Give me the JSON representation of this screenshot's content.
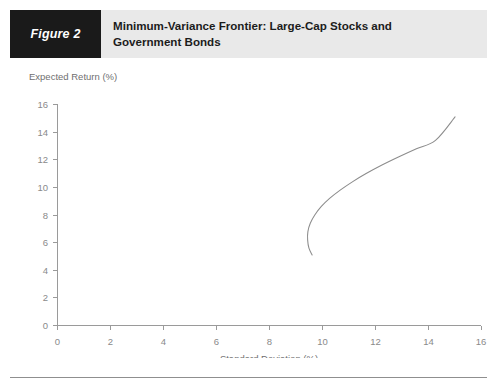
{
  "header": {
    "figure_number": "Figure 2",
    "title_line_1": "Minimum-Variance Frontier: Large-Cap Stocks and",
    "title_line_2": "Government Bonds",
    "band_color": "#e9e9e9",
    "number_box_color": "#1a1a1a",
    "number_text_color": "#ffffff"
  },
  "chart_data": {
    "type": "line",
    "title": "Minimum-Variance Frontier: Large-Cap Stocks and Government Bonds",
    "subtitle": "",
    "xlabel": "Standard Deviation (%)",
    "ylabel": "Expected Return (%)",
    "xlim": [
      0,
      16
    ],
    "ylim": [
      0,
      16
    ],
    "xticks": [
      0,
      2,
      4,
      6,
      8,
      10,
      12,
      14,
      16
    ],
    "yticks": [
      0,
      2,
      4,
      6,
      8,
      10,
      12,
      14,
      16
    ],
    "grid": false,
    "legend": false,
    "legend_position": "none",
    "line_color": "#8c8c8c",
    "axis_color": "#9a9a9a",
    "series": [
      {
        "name": "Minimum-variance frontier",
        "x": [
          9.62,
          9.5,
          9.45,
          9.46,
          9.55,
          9.72,
          9.96,
          10.28,
          10.68,
          11.14,
          11.66,
          12.24,
          12.88,
          13.56,
          14.28,
          15.02
        ],
        "y": [
          5.1,
          5.6,
          6.2,
          6.8,
          7.4,
          8.0,
          8.6,
          9.2,
          9.8,
          10.4,
          11.0,
          11.6,
          12.2,
          12.8,
          13.4,
          15.1
        ]
      }
    ],
    "annotations": {
      "minimum_variance_point": {
        "x": 9.45,
        "y": 6.95
      },
      "upper_endpoint": {
        "x": 15.02,
        "y": 15.1
      },
      "lower_endpoint": {
        "x": 9.62,
        "y": 5.1
      }
    }
  }
}
